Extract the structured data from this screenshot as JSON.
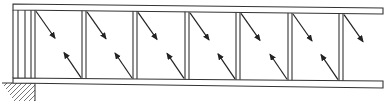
{
  "diagram": {
    "type": "structural-frame",
    "colors": {
      "stroke": "#333333",
      "hatch": "#777777",
      "background": "#ffffff"
    },
    "top_beam": {
      "x1": 13,
      "y1_top": 4,
      "y1_bot": 10,
      "x2": 383,
      "y2_top": 8,
      "y2_bot": 14
    },
    "bottom_beam": {
      "x1": 13,
      "y1_top": 78,
      "y1_bot": 83,
      "x2": 383,
      "y2_top": 81,
      "y2_bot": 88
    },
    "end_verticals_x": [
      13,
      18,
      25
    ],
    "posts_x": [
      31,
      82,
      133,
      185,
      236,
      288,
      339
    ],
    "post_width": 4,
    "panel_count": 7,
    "arrows": {
      "upper_direction": "down-right",
      "lower_direction": "up-left",
      "upper_length": [
        19,
        27
      ],
      "lower_length": [
        -17,
        -25
      ]
    },
    "support": {
      "type": "fixed-ground",
      "surface_y": 83,
      "x_start": 2,
      "x_end": 35,
      "depth": 18
    }
  }
}
